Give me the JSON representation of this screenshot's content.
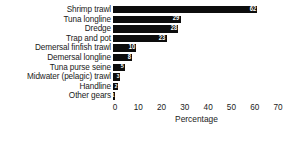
{
  "chart_data": {
    "type": "bar",
    "orientation": "horizontal",
    "title": "",
    "xlabel": "Percentage",
    "ylabel": "",
    "xlim": [
      0,
      70
    ],
    "xticks": [
      0,
      10,
      20,
      30,
      40,
      50,
      60,
      70
    ],
    "grid": false,
    "legend": null,
    "bar_color": "#0d0d0d",
    "value_label_color": "#ffffff",
    "categories": [
      "Shrimp trawl",
      "Tuna longline",
      "Dredge",
      "Trap and pot",
      "Demersal finfish trawl",
      "Demersal longline",
      "Tuna purse seine",
      "Midwater (pelagic) trawl",
      "Handline",
      "Other gears"
    ],
    "values": [
      62,
      29,
      28,
      23,
      10,
      8,
      5,
      3,
      2,
      1
    ],
    "value_labels": [
      "62",
      "29",
      "28",
      "23",
      "10",
      "8",
      "5",
      "3",
      "2",
      "1"
    ]
  },
  "axis": {
    "tick_0": "0",
    "tick_1": "10",
    "tick_2": "20",
    "tick_3": "30",
    "tick_4": "40",
    "tick_5": "50",
    "tick_6": "60",
    "tick_7": "70",
    "x_title": "Percentage"
  },
  "rows": [
    {
      "label": "Shrimp trawl",
      "value": "62"
    },
    {
      "label": "Tuna longline",
      "value": "29"
    },
    {
      "label": "Dredge",
      "value": "28"
    },
    {
      "label": "Trap and pot",
      "value": "23"
    },
    {
      "label": "Demersal finfish trawl",
      "value": "10"
    },
    {
      "label": "Demersal longline",
      "value": "8"
    },
    {
      "label": "Tuna purse seine",
      "value": "5"
    },
    {
      "label": "Midwater (pelagic) trawl",
      "value": "3"
    },
    {
      "label": "Handline",
      "value": "2"
    },
    {
      "label": "Other gears",
      "value": "1"
    }
  ]
}
